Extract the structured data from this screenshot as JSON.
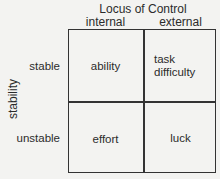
{
  "diagram": {
    "title": "Locus of Control",
    "columns": [
      "internal",
      "external"
    ],
    "axis_label": "stability",
    "rows": [
      {
        "label": "stable",
        "cells": [
          "ability",
          "task\ndifficulty"
        ],
        "cell_lines": [
          [
            "ability"
          ],
          [
            "task",
            "difficulty"
          ]
        ]
      },
      {
        "label": "unstable",
        "cells": [
          "effort",
          "luck"
        ],
        "cell_lines": [
          [
            "effort"
          ],
          [
            "luck"
          ]
        ]
      }
    ]
  }
}
